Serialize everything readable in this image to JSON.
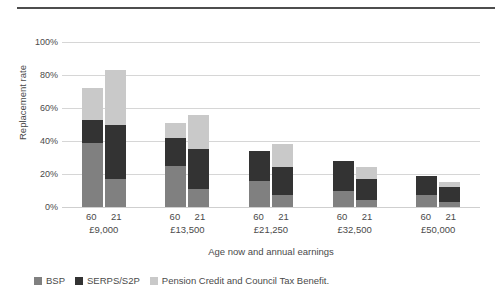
{
  "chart_data": {
    "type": "bar",
    "title": "",
    "xlabel": "Age now and annual earnings",
    "ylabel": "Replacement rate",
    "ylim": [
      0,
      100
    ],
    "yticks": [
      "0%",
      "20%",
      "40%",
      "60%",
      "80%",
      "100%"
    ],
    "ytick_values": [
      0,
      20,
      40,
      60,
      80,
      100
    ],
    "grid": true,
    "stacked": true,
    "legend_position": "bottom-left",
    "categories": [
      "60 £9,000",
      "21 £9,000",
      "60 £13,500",
      "21 £13,500",
      "60 £21,250",
      "21 £21,250",
      "60 £32,500",
      "21 £32,500",
      "60 £50,000",
      "21 £50,000"
    ],
    "groups": [
      {
        "earnings": "£9,000",
        "bars": [
          {
            "age": "60",
            "bsp": 39,
            "serps": 14,
            "pension": 19,
            "total": 72
          },
          {
            "age": "21",
            "bsp": 17,
            "serps": 33,
            "pension": 33,
            "total": 83
          }
        ]
      },
      {
        "earnings": "£13,500",
        "bars": [
          {
            "age": "60",
            "bsp": 25,
            "serps": 17,
            "pension": 9,
            "total": 51
          },
          {
            "age": "21",
            "bsp": 11,
            "serps": 24,
            "pension": 21,
            "total": 56
          }
        ]
      },
      {
        "earnings": "£21,250",
        "bars": [
          {
            "age": "60",
            "bsp": 16,
            "serps": 18,
            "pension": 0,
            "total": 34
          },
          {
            "age": "21",
            "bsp": 7,
            "serps": 17,
            "pension": 14,
            "total": 38
          }
        ]
      },
      {
        "earnings": "£32,500",
        "bars": [
          {
            "age": "60",
            "bsp": 10,
            "serps": 18,
            "pension": 0,
            "total": 28
          },
          {
            "age": "21",
            "bsp": 4,
            "serps": 13,
            "pension": 7,
            "total": 24
          }
        ]
      },
      {
        "earnings": "£50,000",
        "bars": [
          {
            "age": "60",
            "bsp": 7,
            "serps": 12,
            "pension": 0,
            "total": 19
          },
          {
            "age": "21",
            "bsp": 3,
            "serps": 9,
            "pension": 3,
            "total": 15
          }
        ]
      }
    ],
    "series": [
      {
        "name": "BSP",
        "color": "#808080",
        "values": [
          39,
          17,
          25,
          11,
          16,
          7,
          10,
          4,
          7,
          3
        ]
      },
      {
        "name": "SERPS/S2P",
        "color": "#333333",
        "values": [
          14,
          33,
          17,
          24,
          18,
          17,
          18,
          13,
          12,
          9
        ]
      },
      {
        "name": "Pension Credit and Council Tax Benefit.",
        "color": "#c9c9c9",
        "values": [
          19,
          33,
          9,
          21,
          0,
          14,
          0,
          7,
          0,
          3
        ]
      }
    ]
  },
  "legend": {
    "items": [
      {
        "label": "BSP",
        "color": "#808080"
      },
      {
        "label": "SERPS/S2P",
        "color": "#333333"
      },
      {
        "label": "Pension Credit and Council Tax Benefit.",
        "color": "#c9c9c9"
      }
    ]
  },
  "axes": {
    "y_title": "Replacement rate",
    "x_title": "Age now and annual earnings"
  },
  "colors": {
    "bsp": "#808080",
    "serps": "#333333",
    "pension": "#c9c9c9",
    "grid": "#d6d6d6",
    "text": "#4a4a4a",
    "rule": "#4d4d4d"
  }
}
